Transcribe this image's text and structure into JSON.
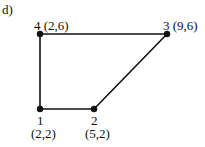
{
  "panel_label": "d)",
  "nodes": [
    {
      "id": "1",
      "coord": "(2,2)",
      "x": 40,
      "y": 109
    },
    {
      "id": "2",
      "coord": "(5,2)",
      "x": 94,
      "y": 109
    },
    {
      "id": "3",
      "coord": "(9,6)",
      "x": 167,
      "y": 34
    },
    {
      "id": "4",
      "coord": "(2,6)",
      "x": 40,
      "y": 34
    }
  ],
  "edges": [
    [
      "1",
      "2"
    ],
    [
      "2",
      "3"
    ],
    [
      "3",
      "4"
    ],
    [
      "4",
      "1"
    ]
  ],
  "labels": {
    "n1": "1",
    "n1c": "(2,2)",
    "n2": "2",
    "n2c": "(5,2)",
    "n3": "3 (9,6)",
    "n4": "4 (2,6)"
  },
  "colors": {
    "line": "#111111",
    "node": "#111111"
  }
}
